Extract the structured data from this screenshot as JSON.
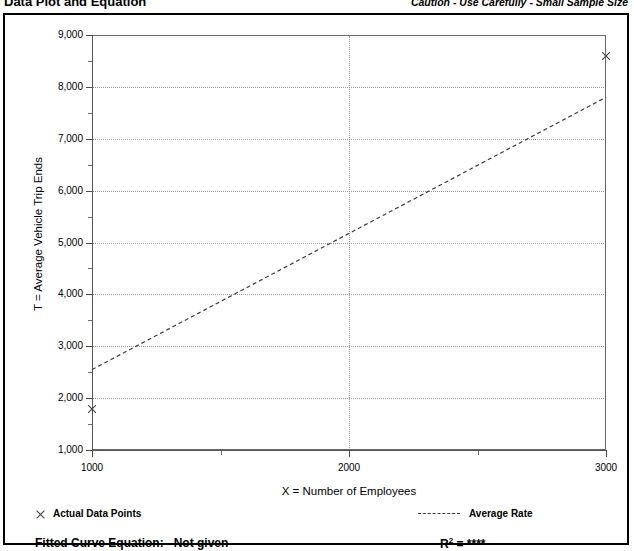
{
  "header": {
    "title": "Data Plot and Equation",
    "caution": "Caution - Use Carefully - Small Sample Size"
  },
  "footer": {
    "data_points_legend": "Actual Data Points",
    "average_rate_legend": "Average Rate",
    "fitted_curve_label": "Fitted Curve Equation:",
    "fitted_curve_value": "Not given",
    "r_squared_label": "R",
    "r_squared_exponent": "2",
    "r_squared_equals": "=",
    "r_squared_value": "****"
  },
  "chart_data": {
    "type": "scatter",
    "title": "Data Plot and Equation",
    "xlabel": "X = Number of Employees",
    "ylabel": "T = Average Vehicle Trip Ends",
    "xlim": [
      1000,
      3000
    ],
    "ylim": [
      1000,
      9000
    ],
    "xticks": [
      1000,
      2000,
      3000
    ],
    "xtick_labels": [
      "1000",
      "2000",
      "3000"
    ],
    "xticks_minor": [
      1500,
      2500
    ],
    "yticks": [
      1000,
      2000,
      3000,
      4000,
      5000,
      6000,
      7000,
      8000,
      9000
    ],
    "ytick_labels": [
      "1,000",
      "2,000",
      "3,000",
      "4,000",
      "5,000",
      "6,000",
      "7,000",
      "8,000",
      "9,000"
    ],
    "yticks_minor": [
      1500,
      2500,
      3500,
      4500,
      5500,
      6500,
      7500,
      8500
    ],
    "grid": true,
    "grid_style": "dotted",
    "legend_position": "below-plot",
    "series": [
      {
        "name": "Actual Data Points",
        "type": "scatter",
        "marker": "x",
        "color": "#3d3d3d",
        "points": [
          {
            "x": 1000,
            "y": 1800
          },
          {
            "x": 3000,
            "y": 8600
          }
        ]
      },
      {
        "name": "Average Rate",
        "type": "line",
        "style": "dashed",
        "color": "#3d3d3d",
        "points": [
          {
            "x": 1000,
            "y": 2550
          },
          {
            "x": 3000,
            "y": 7800
          }
        ]
      }
    ],
    "annotations": {
      "fitted_curve_equation": "Not given",
      "r_squared": "****",
      "caution": "Caution - Use Carefully - Small Sample Size"
    }
  },
  "colors": {
    "frame": "#000000",
    "axis": "#555555",
    "grid": "#9a9a9a",
    "data": "#3d3d3d",
    "background": "#ffffff"
  }
}
